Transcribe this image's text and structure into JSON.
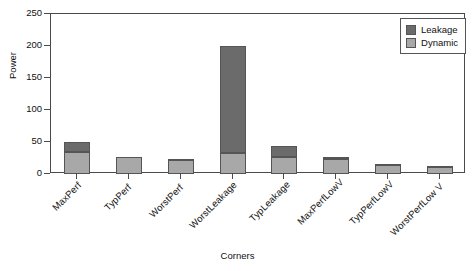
{
  "chart_data": {
    "type": "bar",
    "subtype": "stacked-bar",
    "title": "",
    "xlabel": "Corners",
    "ylabel": "Power",
    "ylim": [
      0,
      250
    ],
    "yticks": [
      0,
      50,
      100,
      150,
      200,
      250
    ],
    "grid": false,
    "legend_position": "top-right",
    "categories": [
      "MaxPerf",
      "TypPerf",
      "WorstPerf",
      "WorstLeakage",
      "TypLeakage",
      "MaxPerfLowV",
      "TypPerfLowV",
      "WorstPerfLow V"
    ],
    "series": [
      {
        "name": "Dynamic",
        "color": "#a8a8a8",
        "values": [
          35,
          26,
          22,
          33,
          27,
          23,
          14,
          11
        ]
      },
      {
        "name": "Leakage",
        "color": "#6b6b6b",
        "values": [
          15,
          1,
          1,
          167,
          17,
          3,
          1,
          1
        ]
      }
    ],
    "totals": [
      50,
      27,
      23,
      200,
      44,
      26,
      15,
      12
    ]
  },
  "legend": {
    "entries": [
      {
        "label": "Leakage",
        "color": "#6b6b6b"
      },
      {
        "label": "Dynamic",
        "color": "#a8a8a8"
      }
    ]
  }
}
